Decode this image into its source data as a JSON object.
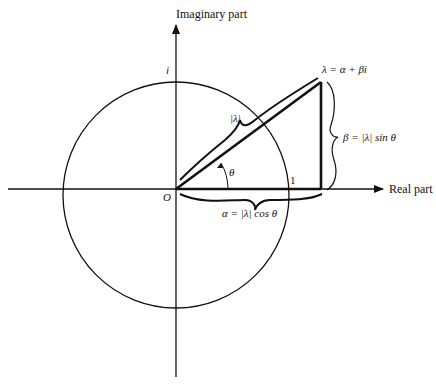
{
  "diagram": {
    "axes": {
      "vertical_label": "Imaginary part",
      "horizontal_label": "Real part"
    },
    "labels": {
      "origin": "O",
      "unit_imag": "i",
      "unit_real": "1",
      "point": "λ = α + βi",
      "modulus": "|λ|",
      "angle": "θ",
      "imag_component": "β = |λ| sin θ",
      "real_component": "α = |λ| cos θ"
    },
    "geometry": {
      "origin": [
        176,
        189
      ],
      "unit_circle_radius": 113,
      "point": [
        321,
        82
      ]
    }
  }
}
